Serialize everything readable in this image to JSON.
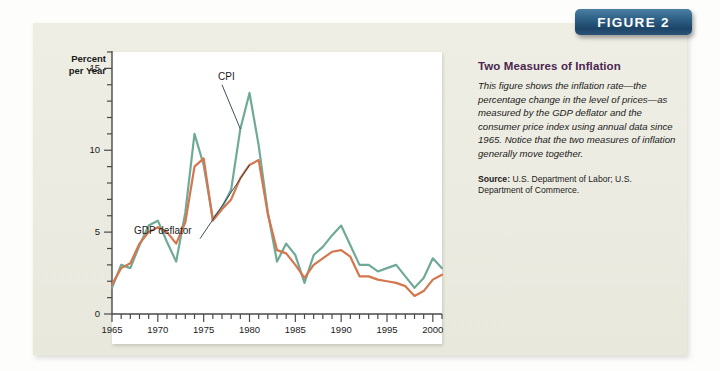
{
  "figure_banner": {
    "label": "FIGURE 2"
  },
  "text_panel": {
    "title": "Two Measures of Inflation",
    "description": "This figure shows the inflation rate—the percentage change in the level of prices—as measured by the GDP deflator and the consumer price index using annual data since 1965. Notice that the two measures of inflation generally move together.",
    "source_label": "Source:",
    "source_text": " U.S. Department of Labor; U.S. Department of Commerce."
  },
  "colors": {
    "cpi_line": "#6faa99",
    "deflator_line": "#d4764e",
    "banner_blue": "#2e5f85",
    "title_purple": "#4a2650",
    "panel_beige": "#ecebe1",
    "plot_white": "#ffffff",
    "axis_gray": "#4a4a4a"
  },
  "chart_data": {
    "type": "line",
    "title": "Two Measures of Inflation",
    "xlabel": "",
    "ylabel": "Percent per Year",
    "ylabel_line1": "Percent",
    "ylabel_line2": "per Year",
    "xlim": [
      1965,
      2001
    ],
    "ylim": [
      0,
      16
    ],
    "yticks": [
      0,
      5,
      10,
      15
    ],
    "ytick_labels": [
      "0",
      "5",
      "10",
      "15"
    ],
    "y_minor_tick_step": 1,
    "xticks": [
      1965,
      1970,
      1975,
      1980,
      1985,
      1990,
      1995,
      2000
    ],
    "xtick_labels": [
      "1965",
      "1970",
      "1975",
      "1980",
      "1985",
      "1990",
      "1995",
      "2000"
    ],
    "x_minor_tick_step": 1,
    "grid": false,
    "legend": "annotated-inline",
    "annotations": [
      {
        "text": "CPI",
        "series": "CPI",
        "point_year": 1979,
        "label_x": 1977.0,
        "label_y": 14.0
      },
      {
        "text": "GDP deflator",
        "series": "GDP deflator",
        "point_year": 1980,
        "label_x": 1974.6,
        "label_y": 4.6
      }
    ],
    "x": [
      1965,
      1966,
      1967,
      1968,
      1969,
      1970,
      1971,
      1972,
      1973,
      1974,
      1975,
      1976,
      1977,
      1978,
      1979,
      1980,
      1981,
      1982,
      1983,
      1984,
      1985,
      1986,
      1987,
      1988,
      1989,
      1990,
      1991,
      1992,
      1993,
      1994,
      1995,
      1996,
      1997,
      1998,
      1999,
      2000,
      2001
    ],
    "series": [
      {
        "name": "CPI",
        "color": "#6faa99",
        "values": [
          1.6,
          3.0,
          2.8,
          4.2,
          5.4,
          5.7,
          4.4,
          3.2,
          6.2,
          11.0,
          9.1,
          5.8,
          6.5,
          7.6,
          11.3,
          13.5,
          10.3,
          6.2,
          3.2,
          4.3,
          3.6,
          1.9,
          3.6,
          4.1,
          4.8,
          5.4,
          4.2,
          3.0,
          3.0,
          2.6,
          2.8,
          3.0,
          2.3,
          1.6,
          2.2,
          3.4,
          2.8
        ]
      },
      {
        "name": "GDP deflator",
        "color": "#d4764e",
        "values": [
          1.8,
          2.8,
          3.1,
          4.3,
          5.0,
          5.3,
          5.0,
          4.3,
          5.6,
          9.0,
          9.5,
          5.7,
          6.4,
          7.0,
          8.3,
          9.1,
          9.4,
          6.1,
          3.9,
          3.7,
          3.0,
          2.2,
          3.0,
          3.4,
          3.8,
          3.9,
          3.5,
          2.3,
          2.3,
          2.1,
          2.0,
          1.9,
          1.7,
          1.1,
          1.4,
          2.1,
          2.4
        ]
      }
    ]
  }
}
